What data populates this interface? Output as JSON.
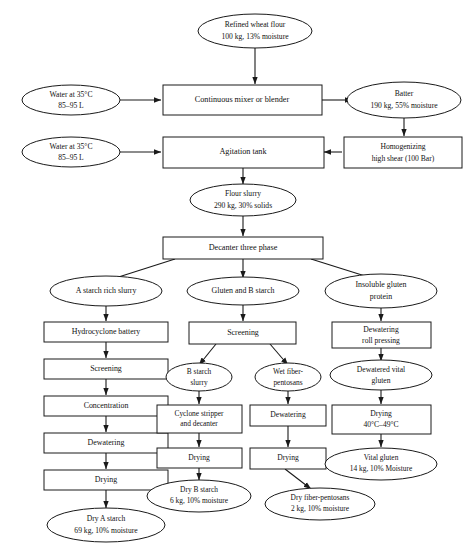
{
  "diagram": {
    "stroke_color": "#1a1a1a",
    "fill_color": "#ffffff",
    "text_color": "#111111"
  },
  "nodes": {
    "refined_wheat_flour": {
      "shape": "ellipse",
      "lines": [
        "Refined wheat flour",
        "100 kg, 13%  moisture"
      ]
    },
    "water_top": {
      "shape": "ellipse",
      "lines": [
        "Water at 35°C",
        "85–95 L"
      ]
    },
    "continuous_mixer": {
      "shape": "box",
      "lines": [
        "Continuous mixer or blender"
      ]
    },
    "batter": {
      "shape": "ellipse",
      "lines": [
        "Batter",
        "190 kg, 55% moisture"
      ]
    },
    "water_second": {
      "shape": "ellipse",
      "lines": [
        "Water at 35°C",
        "85–95 L"
      ]
    },
    "agitation_tank": {
      "shape": "box",
      "lines": [
        "Agitation tank"
      ]
    },
    "homogenizing": {
      "shape": "box",
      "lines": [
        "Homogenizing",
        "high shear (100 Bar)"
      ]
    },
    "flour_slurry": {
      "shape": "ellipse",
      "lines": [
        "Flour slurry",
        "290 kg, 30% solids"
      ]
    },
    "decanter_three_phase": {
      "shape": "box",
      "lines": [
        "Decanter three phase"
      ]
    },
    "a_starch_rich_slurry": {
      "shape": "ellipse",
      "lines": [
        "A starch rich slurry"
      ]
    },
    "gluten_and_b_starch": {
      "shape": "ellipse",
      "lines": [
        "Gluten and B starch"
      ]
    },
    "insoluble_gluten": {
      "shape": "ellipse",
      "lines": [
        "Insoluble gluten",
        "protein"
      ]
    },
    "hydrocyclone_battery": {
      "shape": "box",
      "lines": [
        "Hydrocyclone battery"
      ]
    },
    "screening_left": {
      "shape": "box",
      "lines": [
        "Screening"
      ]
    },
    "concentration": {
      "shape": "box",
      "lines": [
        "Concentration"
      ]
    },
    "dewatering_left": {
      "shape": "box",
      "lines": [
        "Dewatering"
      ]
    },
    "drying_left": {
      "shape": "box",
      "lines": [
        "Drying"
      ]
    },
    "dry_a_starch": {
      "shape": "ellipse",
      "lines": [
        "Dry A starch",
        "69 kg, 10% moisture"
      ]
    },
    "screening_mid": {
      "shape": "box",
      "lines": [
        "Screening"
      ]
    },
    "b_starch_slurry": {
      "shape": "ellipse",
      "lines": [
        "B starch",
        "slurry"
      ]
    },
    "wet_fiber_pentosans": {
      "shape": "ellipse",
      "lines": [
        "Wet fiber-",
        "pentosans"
      ]
    },
    "cyclone_stripper": {
      "shape": "box",
      "lines": [
        "Cyclone stripper",
        "and decanter"
      ]
    },
    "dewatering_mid": {
      "shape": "box",
      "lines": [
        "Dewatering"
      ]
    },
    "drying_mid_left": {
      "shape": "box",
      "lines": [
        "Drying"
      ]
    },
    "drying_mid_right": {
      "shape": "box",
      "lines": [
        "Drying"
      ]
    },
    "dry_b_starch": {
      "shape": "ellipse",
      "lines": [
        "Dry B starch",
        "6 kg, 10% moisture"
      ]
    },
    "dry_fiber_pentosans": {
      "shape": "ellipse",
      "lines": [
        "Dry fiber-pentosans",
        "2 kg, 10% moisture"
      ]
    },
    "dewatering_roll": {
      "shape": "box",
      "lines": [
        "Dewatering",
        "roll pressing"
      ]
    },
    "dewatered_vital": {
      "shape": "ellipse",
      "lines": [
        "Dewatered vital",
        "gluten"
      ]
    },
    "drying_right": {
      "shape": "box",
      "lines": [
        "Drying",
        "40°C–49°C"
      ]
    },
    "vital_gluten": {
      "shape": "ellipse",
      "lines": [
        "Vital gluten",
        "14 kg, 10% Moisture"
      ]
    }
  },
  "edges": [
    {
      "from": "refined_wheat_flour",
      "to": "continuous_mixer"
    },
    {
      "from": "water_top",
      "to": "continuous_mixer"
    },
    {
      "from": "continuous_mixer",
      "to": "batter"
    },
    {
      "from": "batter",
      "to": "homogenizing"
    },
    {
      "from": "homogenizing",
      "to": "agitation_tank"
    },
    {
      "from": "water_second",
      "to": "agitation_tank"
    },
    {
      "from": "agitation_tank",
      "to": "flour_slurry"
    },
    {
      "from": "flour_slurry",
      "to": "decanter_three_phase"
    },
    {
      "from": "decanter_three_phase",
      "to": "a_starch_rich_slurry"
    },
    {
      "from": "decanter_three_phase",
      "to": "gluten_and_b_starch"
    },
    {
      "from": "decanter_three_phase",
      "to": "insoluble_gluten"
    },
    {
      "from": "a_starch_rich_slurry",
      "to": "hydrocyclone_battery"
    },
    {
      "from": "hydrocyclone_battery",
      "to": "screening_left"
    },
    {
      "from": "screening_left",
      "to": "concentration"
    },
    {
      "from": "concentration",
      "to": "dewatering_left"
    },
    {
      "from": "dewatering_left",
      "to": "drying_left"
    },
    {
      "from": "drying_left",
      "to": "dry_a_starch"
    },
    {
      "from": "gluten_and_b_starch",
      "to": "screening_mid"
    },
    {
      "from": "screening_mid",
      "to": "b_starch_slurry"
    },
    {
      "from": "screening_mid",
      "to": "wet_fiber_pentosans"
    },
    {
      "from": "b_starch_slurry",
      "to": "cyclone_stripper"
    },
    {
      "from": "cyclone_stripper",
      "to": "drying_mid_left"
    },
    {
      "from": "drying_mid_left",
      "to": "dry_b_starch"
    },
    {
      "from": "wet_fiber_pentosans",
      "to": "dewatering_mid"
    },
    {
      "from": "dewatering_mid",
      "to": "drying_mid_right"
    },
    {
      "from": "drying_mid_right",
      "to": "dry_fiber_pentosans"
    },
    {
      "from": "insoluble_gluten",
      "to": "dewatering_roll"
    },
    {
      "from": "dewatering_roll",
      "to": "dewatered_vital"
    },
    {
      "from": "dewatered_vital",
      "to": "drying_right"
    },
    {
      "from": "drying_right",
      "to": "vital_gluten"
    }
  ]
}
